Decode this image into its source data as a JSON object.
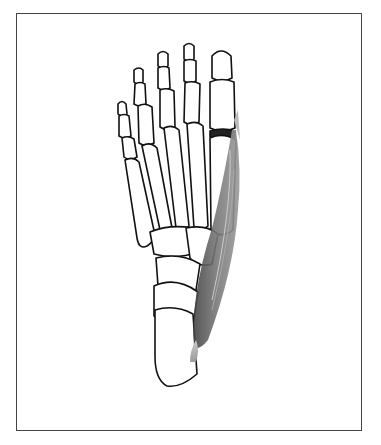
{
  "figure": {
    "highlighted_structure": "abductor-hallucis-muscle",
    "colors": {
      "background": "#ffffff",
      "frame": "#444444",
      "bone_outline": "#111111",
      "bone_fill": "#ffffff",
      "muscle_dark": "#555555",
      "muscle_light": "#bbbbbb"
    }
  }
}
